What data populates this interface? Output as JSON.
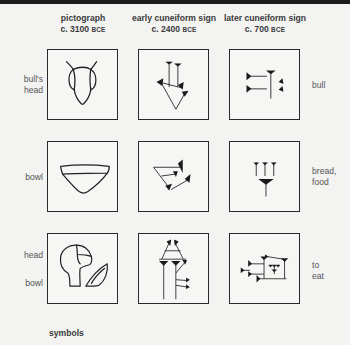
{
  "columns": [
    {
      "title": "pictograph",
      "date": "c. 3100",
      "era": "BCE"
    },
    {
      "title": "early cuneiform sign",
      "date": "c. 2400",
      "era": "BCE"
    },
    {
      "title": "later cuneiform sign",
      "date": "c. 700",
      "era": "BCE"
    }
  ],
  "rows": [
    {
      "left_label": [
        "bull's",
        "head"
      ],
      "right_label": [
        "bull"
      ]
    },
    {
      "left_label": [
        "bowl"
      ],
      "right_label": [
        "bread,",
        "food"
      ]
    },
    {
      "left_label_top": "head",
      "left_label_bottom": "bowl",
      "right_label": [
        "to",
        "eat"
      ]
    }
  ],
  "footer": {
    "label": "symbols"
  },
  "colors": {
    "ink": "#2a2a2a",
    "background": "#f3f3f2",
    "label": "#555555"
  }
}
